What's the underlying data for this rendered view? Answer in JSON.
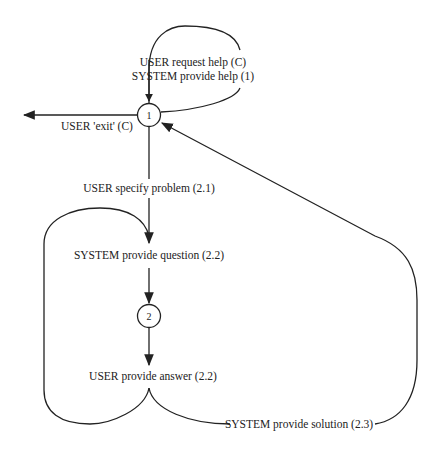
{
  "diagram": {
    "type": "state-transition-network",
    "nodes": [
      {
        "id": "1",
        "label": "1"
      },
      {
        "id": "2",
        "label": "2"
      }
    ],
    "edges": [
      {
        "from": "1",
        "to": "1",
        "label_lines": [
          "USER request help (C)",
          "SYSTEM provide help (1)"
        ]
      },
      {
        "from": "1",
        "to": "exit",
        "label": "USER 'exit' (C)"
      },
      {
        "from": "1",
        "to": "question",
        "label": "USER specify problem (2.1)"
      },
      {
        "from": "question",
        "to": "2",
        "label": "SYSTEM provide question (2.2)"
      },
      {
        "from": "2",
        "to": "answer",
        "label": "USER provide answer (2.2)"
      },
      {
        "from": "answer",
        "to": "question",
        "label": "loop back"
      },
      {
        "from": "answer",
        "to": "1",
        "label": "SYSTEM provide solution (2.3)"
      }
    ],
    "labels": {
      "self_loop_line1": "USER request help (C)",
      "self_loop_line2": "SYSTEM provide help (1)",
      "exit": "USER 'exit' (C)",
      "specify_problem": "USER specify problem (2.1)",
      "provide_question": "SYSTEM provide question (2.2)",
      "provide_answer": "USER provide answer (2.2)",
      "provide_solution": "SYSTEM provide solution (2.3)",
      "node1": "1",
      "node2": "2"
    },
    "colors": {
      "stroke": "#222222",
      "background": "#ffffff"
    }
  }
}
